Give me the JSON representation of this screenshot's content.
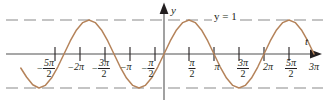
{
  "figure": {
    "axis_labels": {
      "y": "y",
      "t": "t"
    },
    "level_line_label": "y = 1",
    "colors": {
      "curve": "#b5835a",
      "axis": "#8a8a8a",
      "dashed": "#8a8a8a",
      "text": "#231f20",
      "background": "#ffffff"
    }
  },
  "ticks": [
    {
      "id": "neg-5pi-2",
      "sign": "−",
      "num": "5π",
      "den": "2",
      "whole": "",
      "x": 46,
      "value": -7.854
    },
    {
      "id": "neg-2pi",
      "sign": "−",
      "num": "",
      "den": "",
      "whole": "2π",
      "x": 76,
      "value": -6.283
    },
    {
      "id": "neg-3pi-2",
      "sign": "−",
      "num": "3π",
      "den": "2",
      "whole": "",
      "x": 101,
      "value": -4.712
    },
    {
      "id": "neg-pi",
      "sign": "−",
      "num": "",
      "den": "",
      "whole": "π",
      "x": 126,
      "value": -3.142
    },
    {
      "id": "neg-pi-2",
      "sign": "−",
      "num": "π",
      "den": "2",
      "whole": "",
      "x": 148,
      "value": -1.571
    },
    {
      "id": "pos-pi-2",
      "sign": "",
      "num": "π",
      "den": "2",
      "whole": "",
      "x": 192,
      "value": 1.571
    },
    {
      "id": "pos-pi",
      "sign": "",
      "num": "",
      "den": "",
      "whole": "π",
      "x": 217,
      "value": 3.142
    },
    {
      "id": "pos-3pi-2",
      "sign": "",
      "num": "3π",
      "den": "2",
      "whole": "",
      "x": 243,
      "value": 4.712
    },
    {
      "id": "pos-2pi",
      "sign": "",
      "num": "",
      "den": "",
      "whole": "2π",
      "x": 268,
      "value": 6.283
    },
    {
      "id": "pos-5pi-2",
      "sign": "",
      "num": "5π",
      "den": "2",
      "whole": "",
      "x": 291,
      "value": 7.854
    },
    {
      "id": "pos-3pi",
      "sign": "",
      "num": "",
      "den": "",
      "whole": "3π",
      "x": 314,
      "value": 9.425
    }
  ],
  "chart_data": {
    "type": "line",
    "title": "",
    "xlabel": "t",
    "ylabel": "y",
    "function": "y = sin(t)",
    "xlim": [
      -9.6,
      10.2
    ],
    "ylim": [
      -1.45,
      1.45
    ],
    "grid": false,
    "legend": null,
    "series": [
      {
        "name": "y = sin(t)",
        "color": "#b5835a",
        "x": [
          -9.0,
          -8.639,
          -8.247,
          -7.854,
          -7.461,
          -7.069,
          -6.676,
          -6.283,
          -5.89,
          -5.498,
          -5.105,
          -4.712,
          -4.32,
          -3.927,
          -3.534,
          -3.142,
          -2.749,
          -2.356,
          -1.963,
          -1.571,
          -1.178,
          -0.785,
          -0.393,
          0.0,
          0.393,
          0.785,
          1.178,
          1.571,
          1.963,
          2.356,
          2.749,
          3.142,
          3.534,
          3.927,
          4.32,
          4.712,
          5.105,
          5.498,
          5.89,
          6.283,
          6.676,
          7.069,
          7.461,
          7.854,
          8.247,
          8.639,
          9.032,
          9.425
        ],
        "y": [
          -0.412,
          -0.676,
          -0.904,
          -1.0,
          -0.924,
          -0.707,
          -0.383,
          0.0,
          0.383,
          0.707,
          0.924,
          1.0,
          0.924,
          0.707,
          0.383,
          0.0,
          -0.383,
          -0.707,
          -0.924,
          -1.0,
          -0.924,
          -0.707,
          -0.383,
          0.0,
          0.383,
          0.707,
          0.924,
          1.0,
          0.924,
          0.707,
          0.383,
          0.0,
          -0.383,
          -0.707,
          -0.924,
          -1.0,
          -0.924,
          -0.707,
          -0.383,
          0.0,
          0.383,
          0.707,
          0.924,
          1.0,
          0.924,
          0.707,
          0.383,
          0.0
        ]
      }
    ],
    "reference_lines": [
      {
        "name": "y = 1",
        "axis": "horizontal",
        "value": 1,
        "style": "dashed",
        "label": "y = 1"
      },
      {
        "name": "y = -1",
        "axis": "horizontal",
        "value": -1,
        "style": "dashed",
        "label": ""
      }
    ],
    "xticks": [
      -7.854,
      -6.283,
      -4.712,
      -3.142,
      -1.571,
      1.571,
      3.142,
      4.712,
      6.283,
      7.854,
      9.425
    ],
    "xticklabels": [
      "−5π/2",
      "−2π",
      "−3π/2",
      "−π",
      "−π/2",
      "π/2",
      "π",
      "3π/2",
      "2π",
      "5π/2",
      "3π"
    ],
    "yticks": [],
    "yticklabels": []
  }
}
